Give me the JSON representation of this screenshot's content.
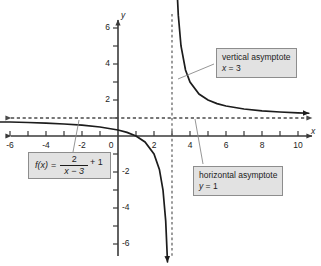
{
  "chart_data": {
    "type": "line",
    "title": "",
    "xlabel": "x",
    "ylabel": "y",
    "xlim": [
      -6.6,
      10.6
    ],
    "ylim": [
      -6.6,
      6.6
    ],
    "grid": false,
    "legend_position": "none",
    "function_latex": "f(x) = 2/(x - 3) + 1",
    "function_parts": {
      "name": "f(x)",
      "equals": "=",
      "numerator": "2",
      "denominator": "x − 3",
      "tail": "+ 1"
    },
    "x_tick_labels": [
      "-6",
      "-4",
      "-2",
      "0",
      "2",
      "4",
      "6",
      "8",
      "10"
    ],
    "x_tick_values": [
      -6,
      -4,
      -2,
      0,
      2,
      4,
      6,
      8,
      10
    ],
    "y_tick_labels": [
      "6",
      "4",
      "2",
      "-2",
      "-4",
      "-6"
    ],
    "y_tick_values": [
      6,
      4,
      2,
      -2,
      -4,
      -6
    ],
    "x_minor_ticks": [
      -6,
      -5,
      -4,
      -3,
      -2,
      -1,
      1,
      2,
      3,
      4,
      5,
      6,
      7,
      8,
      9,
      10
    ],
    "y_minor_ticks": [
      -6,
      -5,
      -4,
      -3,
      -2,
      -1,
      1,
      2,
      3,
      4,
      5,
      6
    ],
    "asymptotes": [
      {
        "kind": "vertical",
        "label": "vertical asymptote",
        "equation": "x = 3",
        "value": 3
      },
      {
        "kind": "horizontal",
        "label": "horizontal asymptote",
        "equation": "y = 1",
        "value": 1
      }
    ],
    "series": [
      {
        "name": "f(x) = 2/(x-3) + 1",
        "branch": "left",
        "points": [
          [
            -6.6,
            0.7778
          ],
          [
            -6.0,
            0.7778
          ],
          [
            -5.0,
            0.75
          ],
          [
            -4.0,
            0.7143
          ],
          [
            -3.0,
            0.6667
          ],
          [
            -2.0,
            0.6
          ],
          [
            -1.0,
            0.5
          ],
          [
            0.0,
            0.3333
          ],
          [
            0.5,
            0.2
          ],
          [
            1.0,
            0.0
          ],
          [
            1.5,
            -0.3333
          ],
          [
            2.0,
            -1.0
          ],
          [
            2.3,
            -1.857
          ],
          [
            2.5,
            -3.0
          ],
          [
            2.65,
            -4.714
          ],
          [
            2.75,
            -7.0
          ]
        ]
      },
      {
        "name": "f(x) = 2/(x-3) + 1",
        "branch": "right",
        "points": [
          [
            3.28,
            8.143
          ],
          [
            3.35,
            6.714
          ],
          [
            3.5,
            5.0
          ],
          [
            3.75,
            3.667
          ],
          [
            4.0,
            3.0
          ],
          [
            4.5,
            2.333
          ],
          [
            5.0,
            2.0
          ],
          [
            5.5,
            1.8
          ],
          [
            6.0,
            1.667
          ],
          [
            7.0,
            1.5
          ],
          [
            8.0,
            1.4
          ],
          [
            9.0,
            1.333
          ],
          [
            10.0,
            1.2857
          ],
          [
            10.6,
            1.2632
          ]
        ]
      }
    ],
    "colors": {
      "curve": "#1c1c1c",
      "axis": "#3a3a3a",
      "asymptote": "#4a4a4a",
      "callout_fill": "#e2e2e2",
      "callout_border": "#8d8d8d",
      "background": "#ffffff",
      "leader_line": "#7a7a7a"
    }
  },
  "callouts": {
    "vertical": {
      "label": "vertical asymptote",
      "equation_var": "x",
      "equation_rest": " = 3"
    },
    "horizontal": {
      "label": "horizontal asymptote",
      "equation_var": "y",
      "equation_rest": " = 1"
    }
  },
  "axes": {
    "x_label": "x",
    "y_label": "y"
  }
}
